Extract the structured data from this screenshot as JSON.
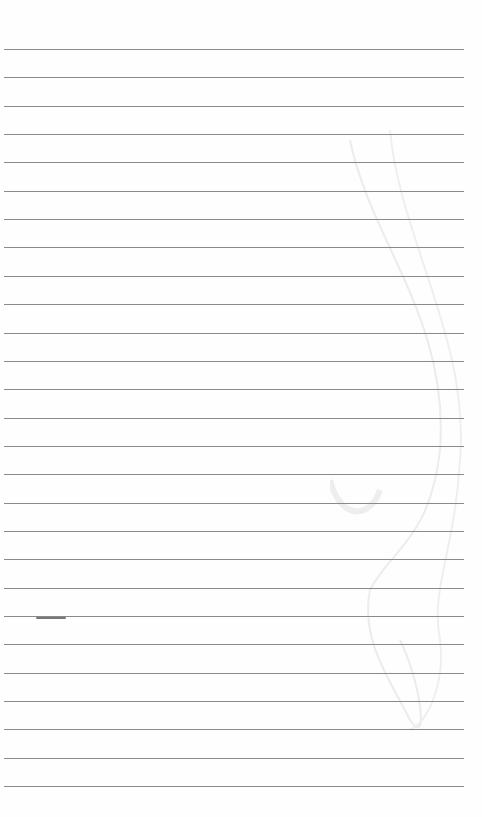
{
  "page": {
    "type": "lined-paper",
    "line_count": 27,
    "first_line_y": 49,
    "line_spacing": 28.35,
    "line_color": "#8a8a8a",
    "background": "#fefefe",
    "watermark": "faint-swirl-clef"
  }
}
